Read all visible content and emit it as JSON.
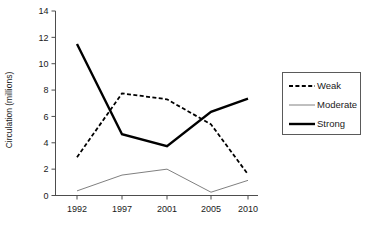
{
  "chart_data": {
    "type": "line",
    "title": "",
    "xlabel": "",
    "ylabel": "Circulation (millions)",
    "categories": [
      "1992",
      "1997",
      "2001",
      "2005",
      "2010"
    ],
    "ylim": [
      0,
      14
    ],
    "yticks": [
      0,
      2,
      4,
      6,
      8,
      10,
      12,
      14
    ],
    "grid": false,
    "legend_position": "right",
    "series": [
      {
        "name": "Weak",
        "style": "dashed",
        "color": "#000000",
        "values": [
          2.9,
          7.75,
          7.3,
          5.4,
          1.6
        ]
      },
      {
        "name": "Moderate",
        "style": "solid-thin",
        "color": "#808080",
        "values": [
          0.35,
          1.55,
          2.0,
          0.25,
          1.15
        ]
      },
      {
        "name": "Strong",
        "style": "solid-thick",
        "color": "#000000",
        "values": [
          11.5,
          4.65,
          3.75,
          6.35,
          7.35
        ]
      }
    ]
  },
  "axis": {
    "y_title": "Circulation (millions)",
    "y_tick_labels": [
      "0",
      "2",
      "4",
      "6",
      "8",
      "10",
      "12",
      "14"
    ],
    "x_tick_labels": [
      "1992",
      "1997",
      "2001",
      "2005",
      "2010"
    ]
  },
  "legend": {
    "entries": [
      {
        "label": "Weak"
      },
      {
        "label": "Moderate"
      },
      {
        "label": "Strong"
      }
    ]
  }
}
